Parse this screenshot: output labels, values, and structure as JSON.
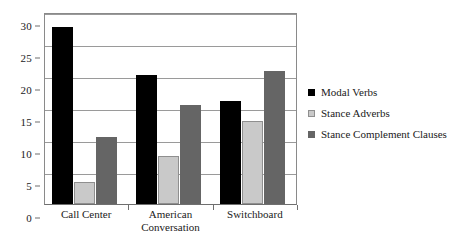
{
  "chart_data": {
    "type": "bar",
    "title": "",
    "subtitle": "",
    "xlabel": "",
    "ylabel": "",
    "ylim": [
      0,
      30
    ],
    "yticks": [
      0,
      5,
      10,
      15,
      20,
      25,
      30
    ],
    "ytick_labels": [
      "0",
      "5",
      "10",
      "15",
      "20",
      "25",
      "30"
    ],
    "grid": true,
    "legend_position": "right",
    "categories": [
      "Call Center",
      "American Conversation",
      "Switchboard"
    ],
    "category_label_lines": [
      [
        "Call Center"
      ],
      [
        "American",
        "Conversation"
      ],
      [
        "Switchboard"
      ]
    ],
    "series": [
      {
        "name": "Modal Verbs",
        "color": "#000000",
        "values": [
          27.7,
          20.2,
          16.1
        ]
      },
      {
        "name": "Stance Adverbs",
        "color": "#c9c9c9",
        "values": [
          3.5,
          7.5,
          13.0
        ]
      },
      {
        "name": "Stance Complement Clauses",
        "color": "#656565",
        "values": [
          10.5,
          15.4,
          20.8
        ]
      }
    ]
  },
  "legend": {
    "items": [
      {
        "label": "Modal Verbs",
        "swatch": "legend-swatch-black"
      },
      {
        "label": "Stance Adverbs",
        "swatch": "legend-swatch-light-gray"
      },
      {
        "label": "Stance Complement Clauses",
        "swatch": "legend-swatch-dark-gray"
      }
    ]
  }
}
